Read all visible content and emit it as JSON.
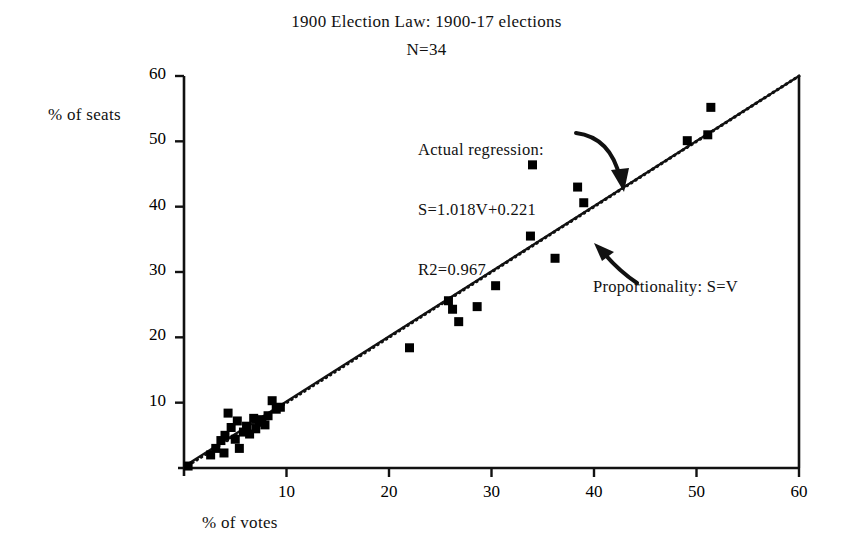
{
  "chart_data": {
    "type": "scatter",
    "title": "1900 Election Law: 1900-17 elections",
    "subtitle": "N=34",
    "xlabel": "% of votes",
    "ylabel": "% of seats",
    "xlim": [
      0,
      60
    ],
    "ylim": [
      0,
      60
    ],
    "xticks": [
      10,
      20,
      30,
      40,
      50,
      60
    ],
    "yticks": [
      10,
      20,
      30,
      40,
      50,
      60
    ],
    "xtick_labels": [
      "10",
      "20",
      "30",
      "40",
      "50",
      "60"
    ],
    "ytick_labels": [
      "10",
      "20",
      "30",
      "40",
      "50",
      "60"
    ],
    "grid": false,
    "legend": "none",
    "marker": "filled-square",
    "marker_color": "#000000",
    "n_points": 34,
    "points": [
      {
        "x": 0.4,
        "y": 0.3
      },
      {
        "x": 2.6,
        "y": 2.0
      },
      {
        "x": 3.1,
        "y": 3.0
      },
      {
        "x": 3.6,
        "y": 4.2
      },
      {
        "x": 3.9,
        "y": 2.3
      },
      {
        "x": 4.0,
        "y": 5.0
      },
      {
        "x": 4.3,
        "y": 8.4
      },
      {
        "x": 4.6,
        "y": 6.2
      },
      {
        "x": 5.0,
        "y": 4.4
      },
      {
        "x": 5.2,
        "y": 7.2
      },
      {
        "x": 5.4,
        "y": 3.0
      },
      {
        "x": 5.8,
        "y": 5.5
      },
      {
        "x": 6.1,
        "y": 6.4
      },
      {
        "x": 6.4,
        "y": 5.2
      },
      {
        "x": 6.8,
        "y": 7.6
      },
      {
        "x": 7.0,
        "y": 6.0
      },
      {
        "x": 7.3,
        "y": 7.0
      },
      {
        "x": 7.6,
        "y": 7.4
      },
      {
        "x": 7.9,
        "y": 6.6
      },
      {
        "x": 8.2,
        "y": 8.0
      },
      {
        "x": 8.6,
        "y": 10.3
      },
      {
        "x": 9.0,
        "y": 9.0
      },
      {
        "x": 9.4,
        "y": 9.3
      },
      {
        "x": 22.0,
        "y": 18.4
      },
      {
        "x": 25.8,
        "y": 25.6
      },
      {
        "x": 26.2,
        "y": 24.3
      },
      {
        "x": 26.8,
        "y": 22.4
      },
      {
        "x": 28.6,
        "y": 24.7
      },
      {
        "x": 30.4,
        "y": 27.9
      },
      {
        "x": 33.8,
        "y": 35.5
      },
      {
        "x": 34.0,
        "y": 46.4
      },
      {
        "x": 36.2,
        "y": 32.1
      },
      {
        "x": 38.4,
        "y": 43.0
      },
      {
        "x": 39.0,
        "y": 40.6
      },
      {
        "x": 49.1,
        "y": 50.1
      },
      {
        "x": 51.1,
        "y": 51.0
      },
      {
        "x": 51.4,
        "y": 55.2
      }
    ],
    "lines": [
      {
        "name": "Actual regression",
        "style": "solid",
        "equation": "S=1.018V+0.221",
        "slope": 1.018,
        "intercept": 0.221,
        "r2": 0.967
      },
      {
        "name": "Proportionality",
        "style": "dotted",
        "equation": "S=V",
        "slope": 1.0,
        "intercept": 0.0
      }
    ],
    "annotations": [
      {
        "name": "regression-annotation",
        "lines": [
          "Actual regression:",
          "S=1.018V+0.221",
          "R2=0.967"
        ],
        "arrow": "curved-down-right"
      },
      {
        "name": "proportionality-annotation",
        "lines": [
          "Proportionality: S=V"
        ],
        "arrow": "curved-up-left"
      }
    ]
  },
  "labels": {
    "title": "1900 Election Law: 1900-17 elections",
    "subtitle": "N=34",
    "ylabel": "% of seats",
    "xlabel": "% of votes",
    "regression_line1": "Actual regression:",
    "regression_line2": "S=1.018V+0.221",
    "regression_line3": "R2=0.967",
    "proportionality": "Proportionality: S=V"
  },
  "axis_pixels": {
    "x0": 184,
    "x1": 799,
    "y0": 468,
    "y1": 76
  }
}
